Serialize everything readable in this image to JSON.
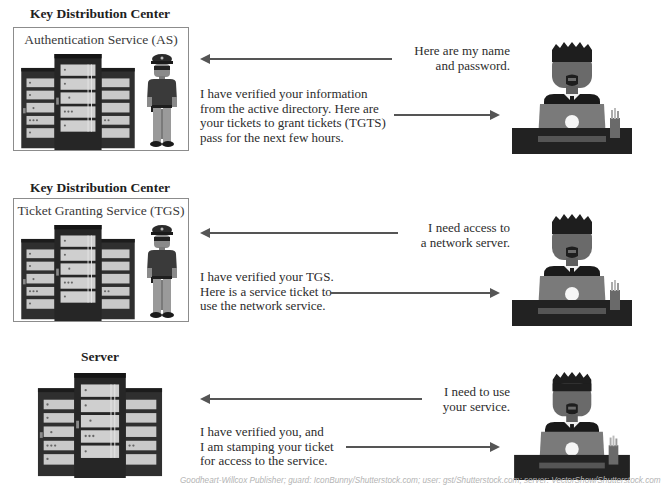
{
  "sections": [
    {
      "title": "Key Distribution Center",
      "box_label": "Authentication Service (AS)",
      "request_message": "Here are my name\nand password.",
      "response_message": "I have verified your information\nfrom the active directory. Here are\nyour tickets to grant tickets (TGTS)\npass for the next few hours.",
      "icons": [
        "server-rack-icon",
        "guard-icon",
        "user-at-laptop-icon"
      ]
    },
    {
      "title": "Key Distribution Center",
      "box_label": "Ticket Granting Service (TGS)",
      "request_message": "I need access to\na network server.",
      "response_message": "I have verified your TGS.\nHere is a service ticket to\nuse the network service.",
      "icons": [
        "server-rack-icon",
        "guard-icon",
        "user-at-laptop-icon"
      ]
    },
    {
      "title": "Server",
      "request_message": "I need to use\nyour service.",
      "response_message": "I have verified you, and\nI am stamping your ticket\nfor access to the service.",
      "icons": [
        "server-rack-icon",
        "user-at-laptop-icon"
      ]
    }
  ],
  "credit": "Goodheart-Willcox Publisher; guard: IconBunny/Shutterstock.com; user: gst/Shutterstock.com; server: VectorShow/Shutterstock.com",
  "colors": {
    "arrow": "#555555",
    "box_border": "#8c8c8c",
    "server_dark": "#2f2f2f",
    "server_panel": "#c8c8c8",
    "user_skin": "#6a6a6a",
    "desk": "#222222",
    "laptop": "#7a7a7a"
  }
}
